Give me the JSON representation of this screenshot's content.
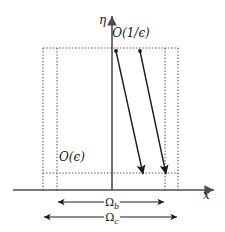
{
  "figure": {
    "background_color": "#ffffff",
    "line_color": "#4d4d4d",
    "dotted_color": "#555555",
    "arrow_color": "#1a1a1a",
    "text_color": "#1a1a1a"
  },
  "axes": {
    "x_axis": {
      "label": "x",
      "name": "horizontal-axis",
      "x_start": 13,
      "x_end": 216,
      "y": 190,
      "label_x": 203,
      "label_y": 199
    },
    "y_axis": {
      "label": "η",
      "name": "vertical-axis",
      "x": 112,
      "y_start": 190,
      "y_end": 14,
      "label_x": 99,
      "label_y": 24
    }
  },
  "regions": {
    "outer_box": {
      "name": "omega-c-box",
      "left": 43,
      "right": 178,
      "top": 48,
      "bottom": 190
    },
    "inner_box": {
      "name": "omega-b-box",
      "left": 57,
      "right": 165,
      "top": 48,
      "bottom": 190
    },
    "epsilon_line": {
      "name": "epsilon-height-line",
      "left": 43,
      "right": 178,
      "y": 173
    }
  },
  "labels": {
    "scale_top": {
      "text_o": "O",
      "text_arg": "(1/ϵ)",
      "full": "O(1/ϵ)",
      "x": 131,
      "y": 37
    },
    "scale_bottom": {
      "text_o": "O",
      "text_arg": "(ϵ)",
      "full": "O(ϵ)",
      "x": 72,
      "y": 161
    }
  },
  "extent_markers": [
    {
      "name": "omega-b-extent",
      "label": "Ω",
      "subscript": "b",
      "x_start": 57,
      "x_end": 165,
      "y": 202,
      "label_x": 111,
      "label_y": 206
    },
    {
      "name": "omega-c-extent",
      "label": "Ω",
      "subscript": "c",
      "x_start": 43,
      "x_end": 178,
      "y": 217,
      "label_x": 111,
      "label_y": 221
    }
  ],
  "trajectories": [
    {
      "name": "trajectory-left",
      "start_x": 116,
      "start_y": 51,
      "end_x": 143,
      "end_y": 176,
      "has_start_dot": true,
      "has_end_arrow": true
    },
    {
      "name": "trajectory-right",
      "start_x": 140,
      "start_y": 51,
      "end_x": 166,
      "end_y": 176,
      "has_start_dot": true,
      "has_end_arrow": true
    }
  ]
}
